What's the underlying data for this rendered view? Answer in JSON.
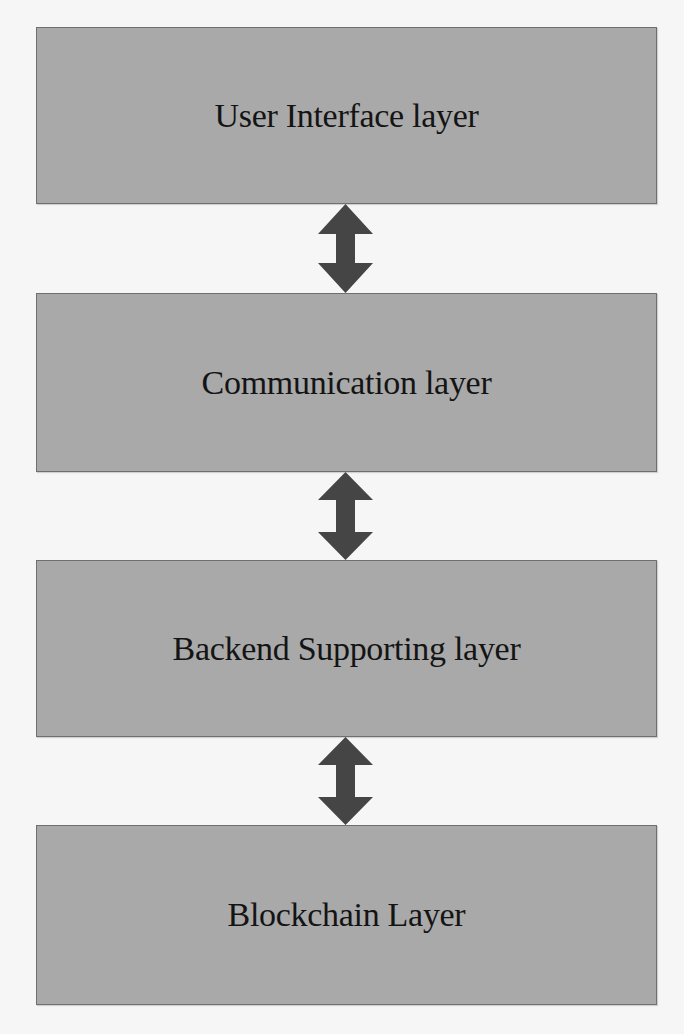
{
  "diagram": {
    "title": "",
    "layers": [
      {
        "label": "User Interface layer"
      },
      {
        "label": "Communication layer"
      },
      {
        "label": "Backend Supporting layer"
      },
      {
        "label": "Blockchain Layer"
      }
    ],
    "connectors": [
      {
        "from": "User Interface layer",
        "to": "Communication layer",
        "type": "bidirectional-arrow"
      },
      {
        "from": "Communication layer",
        "to": "Backend Supporting layer",
        "type": "bidirectional-arrow"
      },
      {
        "from": "Backend Supporting layer",
        "to": "Blockchain Layer",
        "type": "bidirectional-arrow"
      }
    ],
    "colors": {
      "background": "#f6f6f6",
      "box_fill": "#a9a9a9",
      "box_border": "#6f6f6f",
      "arrow": "#454545",
      "text": "#141414"
    }
  }
}
